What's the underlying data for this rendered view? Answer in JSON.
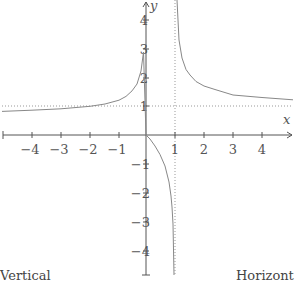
{
  "diagram": {
    "type": "function-graph",
    "function": "y = x/(x-1)",
    "axes": {
      "x_label": "x",
      "y_label": "y",
      "x_ticks": [
        "−4",
        "−3",
        "−2",
        "−1",
        "1",
        "2",
        "3",
        "4"
      ],
      "y_ticks_pos": [
        "1",
        "2",
        "3",
        "4"
      ],
      "y_ticks_neg": [
        "−1",
        "−2",
        "−3",
        "−4"
      ]
    },
    "asymptotes": {
      "vertical": "x = 1",
      "horizontal": "y = 1"
    },
    "colors": {
      "axis": "#555555",
      "curve": "#888888",
      "asymptote": "#999999"
    }
  },
  "captions": {
    "left": "Vertical",
    "right": "Horizont"
  }
}
